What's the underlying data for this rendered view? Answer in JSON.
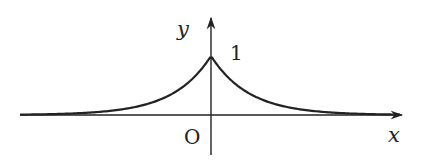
{
  "figure": {
    "function": "y = e^(-|x|)",
    "labels": {
      "y_axis": "y",
      "x_axis": "x",
      "origin": "O",
      "peak_value": "1"
    },
    "colors": {
      "stroke": "#222222",
      "background": "#ffffff"
    }
  },
  "chart_data": {
    "type": "line",
    "title": "",
    "xlabel": "x",
    "ylabel": "y",
    "annotations": [
      "O",
      "1"
    ],
    "series": [
      {
        "name": "y = e^(-|x|)",
        "x": [
          -5,
          -4,
          -3,
          -2,
          -1,
          -0.5,
          0,
          0.5,
          1,
          2,
          3,
          4,
          5
        ],
        "values": [
          0.007,
          0.018,
          0.05,
          0.135,
          0.368,
          0.607,
          1,
          0.607,
          0.368,
          0.135,
          0.05,
          0.018,
          0.007
        ]
      }
    ],
    "grid": false,
    "legend": "none"
  }
}
